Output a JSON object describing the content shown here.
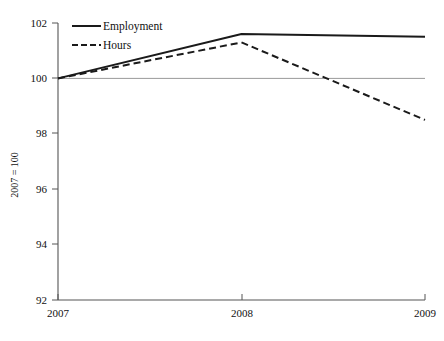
{
  "chart_data": {
    "type": "line",
    "title": "",
    "subtitle": "",
    "xlabel": "",
    "ylabel": "2007 = 100",
    "x": [
      2007,
      2008,
      2009
    ],
    "xtick_labels": [
      "2007",
      "2008",
      "2009"
    ],
    "ytick_labels": [
      "92",
      "94",
      "96",
      "98",
      "100",
      "102"
    ],
    "ytick_values": [
      92,
      94,
      96,
      98,
      100,
      102
    ],
    "xlim": [
      2007,
      2009
    ],
    "ylim": [
      92,
      102
    ],
    "grid": "horizontal-single-at-100",
    "gridline_values": [
      100
    ],
    "gridline_color": "#9a9a9a",
    "legend_position": "top-left-inside",
    "series": [
      {
        "name": "Employment",
        "style": "solid",
        "color": "#1a1a1a",
        "values": [
          100.0,
          101.6,
          101.5
        ]
      },
      {
        "name": "Hours",
        "style": "dashed",
        "color": "#1a1a1a",
        "values": [
          100.0,
          101.3,
          98.5
        ]
      }
    ]
  },
  "axis": {
    "y_title": "2007 = 100",
    "ticks_y": [
      {
        "label": "102",
        "value": 102
      },
      {
        "label": "100",
        "value": 100
      },
      {
        "label": "98",
        "value": 98
      },
      {
        "label": "96",
        "value": 96
      },
      {
        "label": "94",
        "value": 94
      },
      {
        "label": "92",
        "value": 92
      }
    ],
    "ticks_x": [
      {
        "label": "2007",
        "value": 2007
      },
      {
        "label": "2008",
        "value": 2008
      },
      {
        "label": "2009",
        "value": 2009
      }
    ]
  },
  "legend": {
    "items": [
      {
        "label": "Employment",
        "style": "solid"
      },
      {
        "label": "Hours",
        "style": "dashed"
      }
    ]
  },
  "colors": {
    "series_line": "#1a1a1a",
    "axis_line": "#555555",
    "gridline": "#9a9a9a",
    "text": "#111111",
    "background": "#ffffff"
  }
}
